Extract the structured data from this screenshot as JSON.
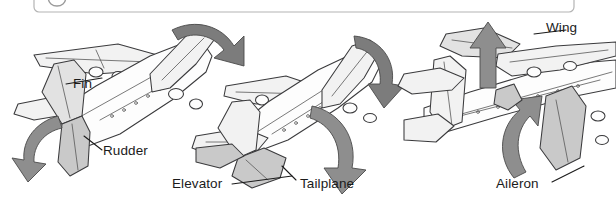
{
  "figure": {
    "background_color": "#ffffff",
    "label_color": "#1b1b1b",
    "arrow_color": "#8e8e8e",
    "outline_color": "#3a3a3c",
    "surface_shade_color": "#c9c9c9"
  },
  "top_badge": {
    "glyph": "circle-outline",
    "clipped": true
  },
  "labels": {
    "fin": "Fin",
    "rudder": "Rudder",
    "elevator": "Elevator",
    "tailplane": "Tailplane",
    "wing": "Wing",
    "aileron": "Aileron"
  },
  "aircraft": [
    {
      "id": "left",
      "view": "rear-quarter-yaw",
      "highlighted_surfaces": [
        "Fin",
        "Rudder"
      ],
      "motion_arrows": [
        {
          "name": "wingtip-sweep-arrow",
          "direction": "curved-right"
        },
        {
          "name": "rudder-swing-arrow",
          "direction": "curved-left"
        }
      ]
    },
    {
      "id": "middle",
      "view": "rear-quarter-pitch",
      "highlighted_surfaces": [
        "Elevator",
        "Tailplane"
      ],
      "motion_arrows": [
        {
          "name": "elevator-down-arrow",
          "direction": "curved-down"
        },
        {
          "name": "tailplane-sweep-arrow",
          "direction": "curved-down"
        }
      ]
    },
    {
      "id": "right",
      "view": "rear-quarter-roll",
      "highlighted_surfaces": [
        "Wing",
        "Aileron"
      ],
      "motion_arrows": [
        {
          "name": "wing-up-arrow",
          "direction": "up"
        },
        {
          "name": "aileron-up-arrow",
          "direction": "curved-up"
        }
      ]
    }
  ]
}
